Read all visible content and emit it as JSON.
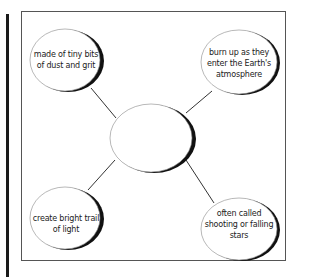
{
  "diagram": {
    "type": "concept-web",
    "center": {
      "label": ""
    },
    "nodes": [
      {
        "id": "tl",
        "position": "top-left",
        "lines": [
          "made of tiny bits",
          "of dust and grit"
        ]
      },
      {
        "id": "tr",
        "position": "top-right",
        "lines": [
          "burn up as they",
          "enter the Earth's",
          "atmosphere"
        ]
      },
      {
        "id": "bl",
        "position": "bottom-left",
        "lines": [
          "create bright trail",
          "of light"
        ]
      },
      {
        "id": "br",
        "position": "bottom-right",
        "lines": [
          "often called",
          "shooting or falling",
          "stars"
        ]
      }
    ],
    "colors": {
      "line": "#333333",
      "shadow": "#111111",
      "frame": "#555555",
      "background": "#ffffff"
    }
  }
}
